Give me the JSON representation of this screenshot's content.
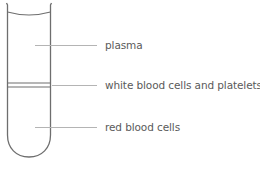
{
  "diagram": {
    "labels": {
      "plasma": "plasma",
      "white_blood_cells": "white blood cells and platelets",
      "red_blood_cells": "red blood cells"
    },
    "colors": {
      "outline": "#6e6e6e",
      "leader_line": "#b4b4b4",
      "label_text": "#5a5a5a"
    }
  }
}
